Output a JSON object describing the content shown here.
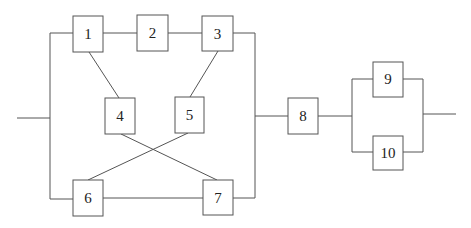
{
  "diagram": {
    "type": "reliability-block-diagram",
    "blocks": [
      {
        "id": "1",
        "label": "1"
      },
      {
        "id": "2",
        "label": "2"
      },
      {
        "id": "3",
        "label": "3"
      },
      {
        "id": "4",
        "label": "4"
      },
      {
        "id": "5",
        "label": "5"
      },
      {
        "id": "6",
        "label": "6"
      },
      {
        "id": "7",
        "label": "7"
      },
      {
        "id": "8",
        "label": "8"
      },
      {
        "id": "9",
        "label": "9"
      },
      {
        "id": "10",
        "label": "10"
      }
    ],
    "connections": [
      [
        "input",
        "1"
      ],
      [
        "input",
        "6"
      ],
      [
        "1",
        "2"
      ],
      [
        "2",
        "3"
      ],
      [
        "1",
        "4"
      ],
      [
        "3",
        "5"
      ],
      [
        "4",
        "7"
      ],
      [
        "5",
        "6"
      ],
      [
        "6",
        "7"
      ],
      [
        "3",
        "8"
      ],
      [
        "7",
        "8"
      ],
      [
        "8",
        "9"
      ],
      [
        "8",
        "10"
      ],
      [
        "9",
        "output"
      ],
      [
        "10",
        "output"
      ]
    ],
    "colors": {
      "line": "#555555",
      "background": "#ffffff",
      "text": "#222222"
    }
  }
}
